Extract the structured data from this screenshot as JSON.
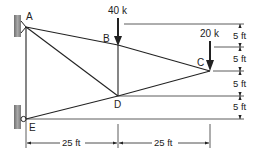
{
  "diagram": {
    "type": "truss",
    "nodes": [
      {
        "id": "A",
        "label": "A",
        "x": 26,
        "y": 27
      },
      {
        "id": "B",
        "label": "B",
        "x": 118,
        "y": 45
      },
      {
        "id": "C",
        "label": "C",
        "x": 210,
        "y": 71
      },
      {
        "id": "D",
        "label": "D",
        "x": 118,
        "y": 96
      },
      {
        "id": "E",
        "label": "E",
        "x": 26,
        "y": 119
      }
    ],
    "members": [
      [
        "A",
        "B"
      ],
      [
        "B",
        "C"
      ],
      [
        "A",
        "D"
      ],
      [
        "B",
        "D"
      ],
      [
        "D",
        "C"
      ],
      [
        "E",
        "D"
      ],
      [
        "A",
        "E"
      ]
    ],
    "supports": [
      {
        "node": "A",
        "type": "pin-wall"
      },
      {
        "node": "E",
        "type": "roller-wall"
      }
    ],
    "loads": [
      {
        "node": "B",
        "label": "40 k",
        "direction": "down"
      },
      {
        "node": "C",
        "label": "20 k",
        "direction": "down"
      }
    ],
    "dimensions": {
      "horizontal": [
        {
          "label": "25 ft",
          "from": "E",
          "to": "D"
        },
        {
          "label": "25 ft",
          "from": "D",
          "to": "C"
        }
      ],
      "vertical": [
        {
          "label": "5 ft"
        },
        {
          "label": "5 ft"
        },
        {
          "label": "5 ft"
        },
        {
          "label": "5 ft"
        }
      ]
    },
    "colors": {
      "line": "#222222",
      "wall": "#8a8a8a"
    }
  }
}
